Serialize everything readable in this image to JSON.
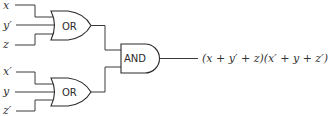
{
  "diagram": {
    "type": "logic-circuit",
    "inputs_top": [
      "x",
      "y′",
      "z"
    ],
    "inputs_bottom": [
      "x′",
      "y",
      "z′"
    ],
    "gates": {
      "or_top": "OR",
      "or_bottom": "OR",
      "and": "AND"
    },
    "output_expression": "(x + y′ + z)(x′ + y + z′)",
    "colors": {
      "line": "#3a3a3a",
      "text": "#333333",
      "background": "#ffffff"
    }
  }
}
